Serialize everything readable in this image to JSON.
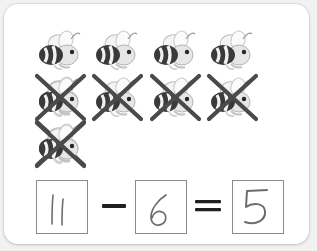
{
  "worksheet": {
    "type": "subtraction-picture-worksheet",
    "colors": {
      "page_background": "#f2f2f2",
      "card_background": "#ffffff",
      "bee_dark": "#2e2e2e",
      "bee_light": "#e8e8e8",
      "cross_stroke": "#4a4a4a",
      "box_border": "#8a8a8a",
      "handwriting": "#6d6d6d",
      "operator": "#1f1f1f"
    },
    "counters": {
      "icon_name": "bee-icon",
      "total_count": 11,
      "crossed_out_count": 6,
      "remaining_count": 5,
      "rows": [
        {
          "row_label": "row-1",
          "count": 5,
          "crossed_out": false,
          "cells": [
            {
              "crossed": false
            },
            {
              "crossed": false
            },
            {
              "crossed": false
            },
            {
              "crossed": false
            },
            {
              "crossed": false
            }
          ]
        },
        {
          "row_label": "row-2",
          "count": 5,
          "crossed_out": true,
          "cells": [
            {
              "crossed": true
            },
            {
              "crossed": true
            },
            {
              "crossed": true
            },
            {
              "crossed": true
            },
            {
              "crossed": true
            }
          ]
        },
        {
          "row_label": "row-3",
          "count": 1,
          "crossed_out": true,
          "cells": [
            {
              "crossed": true
            }
          ]
        }
      ]
    },
    "equation": {
      "minuend": "11",
      "operator_subtract": "-",
      "subtrahend": "6",
      "operator_equals": "=",
      "answer": "5",
      "minuend_style": "handwritten",
      "subtrahend_style": "handwritten",
      "answer_style": "handwritten-child",
      "operator_subtract_name": "minus-sign",
      "operator_equals_name": "equals-sign"
    }
  }
}
